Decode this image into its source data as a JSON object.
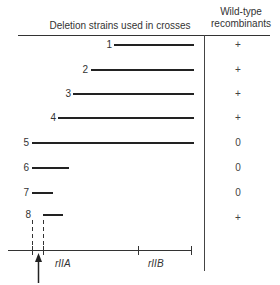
{
  "header": {
    "left_title": "Deletion strains used in crosses",
    "right_title_line1": "Wild-type",
    "right_title_line2": "recombinants"
  },
  "rows": [
    {
      "label": "1",
      "result": "+"
    },
    {
      "label": "2",
      "result": "+"
    },
    {
      "label": "3",
      "result": "+"
    },
    {
      "label": "4",
      "result": "+"
    },
    {
      "label": "5",
      "result": "0"
    },
    {
      "label": "6",
      "result": "0"
    },
    {
      "label": "7",
      "result": "0"
    },
    {
      "label": "8",
      "result": "+"
    }
  ],
  "axis": {
    "label_a": "rIIA",
    "label_b": "rIIB"
  }
}
